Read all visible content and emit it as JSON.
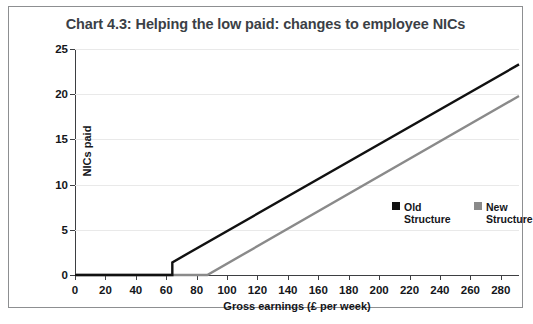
{
  "chart_data": {
    "type": "line",
    "title": "Chart 4.3: Helping the low paid: changes to employee NICs",
    "xlabel": "Gross earnings (£ per week)",
    "ylabel": "NICs paid",
    "xlim": [
      0,
      292
    ],
    "ylim": [
      0,
      25
    ],
    "xticks": [
      0,
      20,
      40,
      60,
      80,
      100,
      120,
      140,
      160,
      180,
      200,
      220,
      240,
      260,
      280
    ],
    "yticks": [
      0,
      5,
      10,
      15,
      20,
      25
    ],
    "grid": "horizontal",
    "legend_position": "inside-right",
    "series": [
      {
        "name": "Old Structure",
        "color": "#111111",
        "points": [
          {
            "x": 0,
            "y": 0
          },
          {
            "x": 64,
            "y": 0
          },
          {
            "x": 64,
            "y": 1.4
          },
          {
            "x": 292,
            "y": 23.3
          }
        ]
      },
      {
        "name": "New Structure",
        "color": "#8a8a8a",
        "points": [
          {
            "x": 0,
            "y": 0
          },
          {
            "x": 87,
            "y": 0
          },
          {
            "x": 292,
            "y": 19.8
          }
        ]
      }
    ]
  },
  "legend": {
    "items": [
      {
        "label": "Old Structure",
        "color": "#111111"
      },
      {
        "label": "New Structure",
        "color": "#8a8a8a"
      }
    ]
  }
}
